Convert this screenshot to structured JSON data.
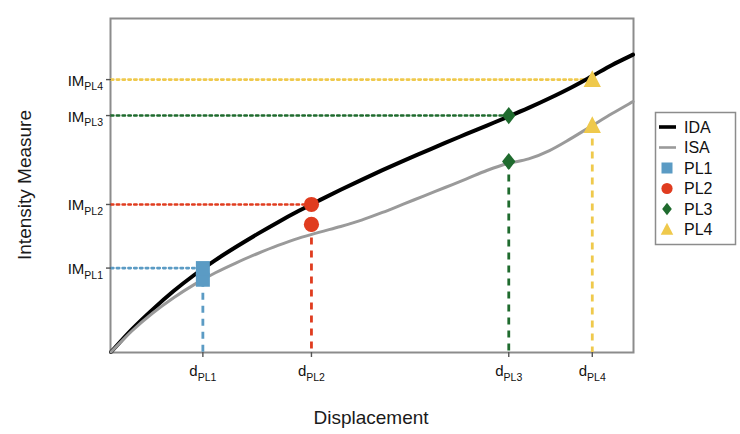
{
  "figure": {
    "background": "#ffffff",
    "plot_frame_color": "#808080"
  },
  "axes": {
    "ylabel": "Intensity Measure",
    "xlabel": "Displacement",
    "y_ticks": [
      {
        "base": "IM",
        "sub": "PL1"
      },
      {
        "base": "IM",
        "sub": "PL2"
      },
      {
        "base": "IM",
        "sub": "PL3"
      },
      {
        "base": "IM",
        "sub": "PL4"
      }
    ],
    "x_ticks": [
      {
        "base": "d",
        "sub": "PL1"
      },
      {
        "base": "d",
        "sub": "PL2"
      },
      {
        "base": "d",
        "sub": "PL3"
      },
      {
        "base": "d",
        "sub": "PL4"
      }
    ]
  },
  "legend": {
    "items": [
      {
        "label": "IDA",
        "type": "line",
        "color": "#000000"
      },
      {
        "label": "ISA",
        "type": "line",
        "color": "#9a9a9a"
      },
      {
        "label": "PL1",
        "type": "square",
        "color": "#5B9BC4"
      },
      {
        "label": "PL2",
        "type": "circle",
        "color": "#E03C1F"
      },
      {
        "label": "PL3",
        "type": "diamond",
        "color": "#1F6B2E"
      },
      {
        "label": "PL4",
        "type": "triangle",
        "color": "#EFC94C"
      }
    ]
  },
  "chart_data": {
    "type": "line",
    "title": "",
    "xlabel": "Displacement",
    "ylabel": "Intensity Measure",
    "xlim": [
      0,
      1
    ],
    "ylim": [
      0,
      1
    ],
    "grid": false,
    "legend_position": "right-outside",
    "series": [
      {
        "name": "IDA",
        "color": "#000000",
        "width": 4,
        "x": [
          0.0,
          0.04,
          0.08,
          0.12,
          0.16,
          0.2,
          0.24,
          0.28,
          0.32,
          0.36,
          0.4,
          0.44,
          0.48,
          0.52,
          0.56,
          0.6,
          0.64,
          0.68,
          0.72,
          0.76,
          0.8,
          0.84,
          0.88,
          0.92,
          0.96,
          1.0
        ],
        "y": [
          0.0,
          0.068,
          0.128,
          0.183,
          0.232,
          0.276,
          0.316,
          0.354,
          0.39,
          0.424,
          0.456,
          0.487,
          0.517,
          0.546,
          0.574,
          0.601,
          0.628,
          0.654,
          0.68,
          0.706,
          0.733,
          0.762,
          0.793,
          0.827,
          0.862,
          0.893
        ]
      },
      {
        "name": "ISA",
        "color": "#9a9a9a",
        "width": 3,
        "x": [
          0.0,
          0.04,
          0.08,
          0.12,
          0.16,
          0.2,
          0.24,
          0.28,
          0.32,
          0.36,
          0.4,
          0.44,
          0.48,
          0.52,
          0.56,
          0.6,
          0.64,
          0.68,
          0.72,
          0.76,
          0.8,
          0.84,
          0.88,
          0.92,
          0.96,
          1.0
        ],
        "y": [
          0.0,
          0.063,
          0.117,
          0.163,
          0.203,
          0.238,
          0.268,
          0.295,
          0.32,
          0.342,
          0.36,
          0.377,
          0.396,
          0.419,
          0.444,
          0.469,
          0.494,
          0.519,
          0.545,
          0.566,
          0.58,
          0.605,
          0.64,
          0.678,
          0.716,
          0.752
        ]
      }
    ],
    "performance_levels": [
      {
        "name": "PL1",
        "color": "#5B9BC4",
        "marker": "square",
        "d": 0.176,
        "im_level": 0.252,
        "ida_point": {
          "x": 0.176,
          "y": 0.252
        },
        "isa_point": {
          "x": 0.176,
          "y": 0.217
        },
        "im_label": "IM PL1",
        "d_label": "d PL1"
      },
      {
        "name": "PL2",
        "color": "#E03C1F",
        "marker": "circle",
        "d": 0.384,
        "im_level": 0.443,
        "ida_point": {
          "x": 0.384,
          "y": 0.443
        },
        "isa_point": {
          "x": 0.384,
          "y": 0.383
        },
        "im_label": "IM PL2",
        "d_label": "d PL2"
      },
      {
        "name": "PL3",
        "color": "#1F6B2E",
        "marker": "diamond",
        "d": 0.762,
        "im_level": 0.71,
        "ida_point": {
          "x": 0.762,
          "y": 0.71
        },
        "isa_point": {
          "x": 0.762,
          "y": 0.572
        },
        "im_label": "IM PL3",
        "d_label": "d PL3"
      },
      {
        "name": "PL4",
        "color": "#EFC94C",
        "marker": "triangle",
        "d": 0.922,
        "im_level": 0.818,
        "ida_point": {
          "x": 0.922,
          "y": 0.818
        },
        "isa_point": {
          "x": 0.922,
          "y": 0.68
        },
        "im_label": "IM PL4",
        "d_label": "d PL4"
      }
    ]
  }
}
